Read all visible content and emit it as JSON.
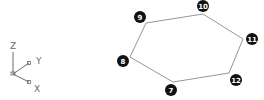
{
  "axis_triad": {
    "labels": {
      "z": "Z",
      "y": "Y",
      "x": "X"
    },
    "color": "#6a6a6a"
  },
  "polygon": {
    "shape": "hexagon",
    "edge_color": "#8a8a8a",
    "vertices": [
      {
        "id": "9",
        "label": "9",
        "vx": 146,
        "vy": 23,
        "cx": 140,
        "cy": 17
      },
      {
        "id": "10",
        "label": "10",
        "vx": 203,
        "vy": 14,
        "cx": 203,
        "cy": 6
      },
      {
        "id": "11",
        "label": "11",
        "vx": 243,
        "vy": 39,
        "cx": 252,
        "cy": 39
      },
      {
        "id": "12",
        "label": "12",
        "vx": 229,
        "vy": 73,
        "cx": 236,
        "cy": 80
      },
      {
        "id": "7",
        "label": "7",
        "vx": 173,
        "vy": 82,
        "cx": 171,
        "cy": 90
      },
      {
        "id": "8",
        "label": "8",
        "vx": 130,
        "vy": 57,
        "cx": 123,
        "cy": 61
      }
    ],
    "marker_color": "#111111"
  }
}
